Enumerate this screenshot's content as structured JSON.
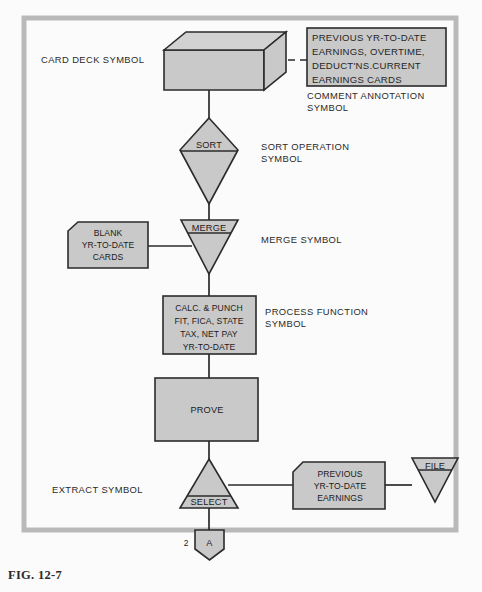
{
  "figure": {
    "caption": "FIG. 12-7"
  },
  "nodes": {
    "card_deck": {
      "name": "card-deck-symbol",
      "label": ""
    },
    "comment_box": {
      "lines": [
        "PREVIOUS YR-TO-DATE",
        "EARNINGS, OVERTIME,",
        "DEDUCT'NS.CURRENT",
        "EARNINGS CARDS"
      ]
    },
    "sort": {
      "label": "SORT"
    },
    "merge": {
      "label": "MERGE"
    },
    "blank_cards": {
      "lines": [
        "BLANK",
        "YR-TO-DATE",
        "CARDS"
      ]
    },
    "process": {
      "lines": [
        "CALC. & PUNCH",
        "FIT, FICA, STATE",
        "TAX, NET PAY",
        "YR-TO-DATE"
      ]
    },
    "prove": {
      "label": "PROVE"
    },
    "select": {
      "label": "SELECT"
    },
    "previous_earnings_card": {
      "lines": [
        "PREVIOUS",
        "YR-TO-DATE",
        "EARNINGS"
      ]
    },
    "file": {
      "label": "FILE"
    },
    "connector_a": {
      "label": "A",
      "number": "2"
    }
  },
  "annotations": {
    "card_deck_symbol": "CARD DECK SYMBOL",
    "comment_annotation_symbol": [
      "COMMENT ANNOTATION",
      "SYMBOL"
    ],
    "sort_operation_symbol": [
      "SORT OPERATION",
      "SYMBOL"
    ],
    "merge_symbol": "MERGE SYMBOL",
    "process_function_symbol": [
      "PROCESS FUNCTION",
      "SYMBOL"
    ],
    "extract_symbol": "EXTRACT SYMBOL"
  },
  "colors": {
    "shape_fill": "#c9c9c9",
    "shape_stroke": "#2b2b2b",
    "frame": "#b9b9b9",
    "background": "#fbfbfb",
    "text": "#1b1b1b"
  }
}
